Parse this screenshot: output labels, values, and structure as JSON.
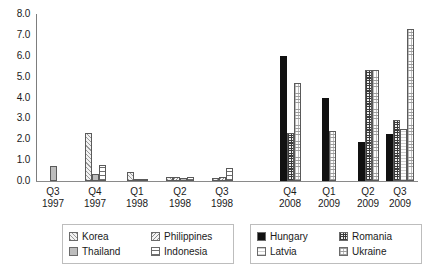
{
  "chart_data": {
    "type": "bar",
    "title": "",
    "subtitle": "",
    "xlabel": "",
    "ylabel": "",
    "ylim": [
      0.0,
      8.0
    ],
    "ytick_step": 1.0,
    "ytick_labels": [
      "0.0",
      "1.0",
      "2.0",
      "3.0",
      "4.0",
      "5.0",
      "6.0",
      "7.0",
      "8.0"
    ],
    "grid": false,
    "legend_position": "bottom",
    "categories": [
      {
        "quarter": "Q3",
        "year": "1997"
      },
      {
        "quarter": "Q4",
        "year": "1997"
      },
      {
        "quarter": "Q1",
        "year": "1998"
      },
      {
        "quarter": "Q2",
        "year": "1998"
      },
      {
        "quarter": "Q3",
        "year": "1998"
      },
      {
        "quarter": "Q4",
        "year": "2008"
      },
      {
        "quarter": "Q1",
        "year": "2009"
      },
      {
        "quarter": "Q2",
        "year": "2009"
      },
      {
        "quarter": "Q3",
        "year": "2009"
      }
    ],
    "series": [
      {
        "name": "Korea",
        "pattern": "diagonal-hatch-light",
        "values": [
          0.0,
          2.3,
          0.45,
          0.2,
          0.15,
          null,
          null,
          null,
          null
        ]
      },
      {
        "name": "Philippines",
        "pattern": "diagonal-hatch",
        "values": [
          0.0,
          0.0,
          0.1,
          0.2,
          0.2,
          null,
          null,
          null,
          null
        ]
      },
      {
        "name": "Thailand",
        "pattern": "solid-gray",
        "values": [
          0.7,
          0.35,
          0.0,
          0.15,
          0.0,
          null,
          null,
          null,
          null
        ]
      },
      {
        "name": "Indonesia",
        "pattern": "horizontal-lines",
        "values": [
          0.0,
          0.75,
          0.1,
          0.2,
          0.6,
          null,
          null,
          null,
          null
        ]
      },
      {
        "name": "Hungary",
        "pattern": "solid-black",
        "values": [
          null,
          null,
          null,
          null,
          null,
          6.0,
          4.0,
          1.85,
          2.25
        ]
      },
      {
        "name": "Romania",
        "pattern": "checker-grid",
        "values": [
          null,
          null,
          null,
          null,
          null,
          2.3,
          0.0,
          5.3,
          2.9
        ]
      },
      {
        "name": "Latvia",
        "pattern": "dotted-vertical",
        "values": [
          null,
          null,
          null,
          null,
          null,
          0.0,
          0.0,
          0.0,
          2.5
        ]
      },
      {
        "name": "Ukraine",
        "pattern": "fine-dot-grid",
        "values": [
          null,
          null,
          null,
          null,
          null,
          4.7,
          2.4,
          5.3,
          7.3
        ]
      }
    ],
    "legend_left": [
      "Korea",
      "Philippines",
      "Thailand",
      "Indonesia"
    ],
    "legend_right": [
      "Hungary",
      "Romania",
      "Latvia",
      "Ukraine"
    ],
    "colors": {
      "axis": "#7d7d7d",
      "text": "#1a1a1a",
      "hungary": "#111111",
      "thailand": "#bdbdbd",
      "legend_border": "#bdbdbd"
    }
  }
}
